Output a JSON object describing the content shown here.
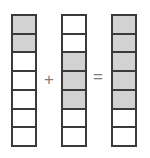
{
  "figure": {
    "operators": {
      "plus": "+",
      "equals": "="
    },
    "colors": {
      "shaded": "#d2d2d2",
      "unshaded": "#ffffff",
      "border": "#3a3a3a",
      "operator": "#7d7d7d",
      "background": "#ffffff"
    }
  },
  "chart_data": {
    "type": "bar",
    "xlabel": "",
    "ylabel": "",
    "orientation": "vertical-stacked-cells",
    "total_cells_per_bar": 7,
    "categories": [
      "addend-1",
      "addend-2",
      "sum"
    ],
    "values": [
      2,
      3,
      5
    ],
    "series": [
      {
        "name": "shaded cells",
        "values": [
          2,
          3,
          5
        ]
      },
      {
        "name": "unshaded cells",
        "values": [
          5,
          4,
          2
        ]
      }
    ],
    "expression": "2/7 + 3/7 = 5/7",
    "bars": [
      {
        "name": "addend-1",
        "shaded_count": 2,
        "total": 7,
        "fraction": "2/7",
        "cells": [
          "shaded",
          "shaded",
          "unshaded",
          "unshaded",
          "unshaded",
          "unshaded",
          "unshaded"
        ]
      },
      {
        "name": "addend-2",
        "shaded_count": 3,
        "total": 7,
        "fraction": "3/7",
        "cells": [
          "unshaded",
          "unshaded",
          "shaded",
          "shaded",
          "shaded",
          "unshaded",
          "unshaded"
        ]
      },
      {
        "name": "sum",
        "shaded_count": 5,
        "total": 7,
        "fraction": "5/7",
        "cells": [
          "shaded",
          "shaded",
          "shaded",
          "shaded",
          "shaded",
          "unshaded",
          "unshaded"
        ]
      }
    ],
    "grid": false,
    "legend": false
  }
}
